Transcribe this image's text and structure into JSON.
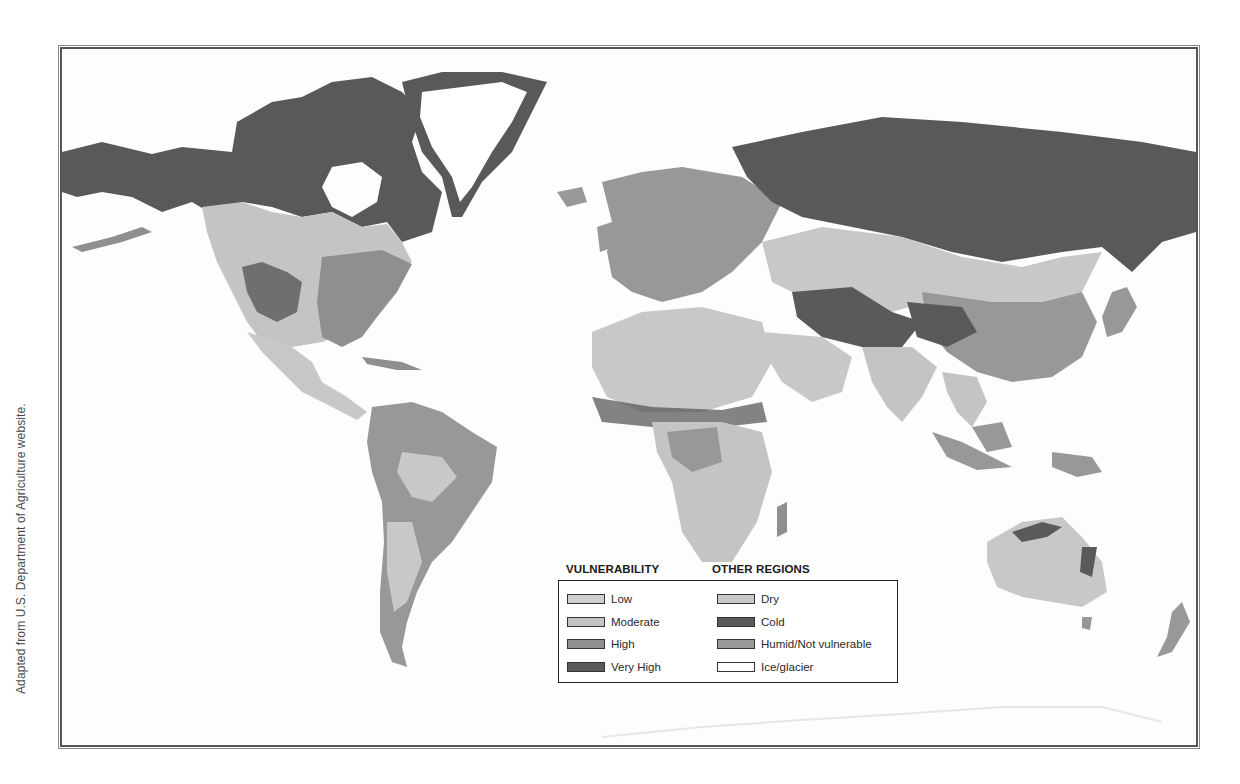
{
  "credit": "Adapted from U.S. Department of Agriculture website.",
  "map": {
    "type": "world choropleth (grayscale)",
    "topic": "Vulnerability of land regions",
    "colors": {
      "ocean": "#fdfdfd",
      "low": "#cfcfcf",
      "moderate": "#c4c4c4",
      "high": "#8f8f8f",
      "very_high": "#5a5a5a",
      "dry": "#c8c8c8",
      "cold": "#595959",
      "humid": "#989898",
      "ice": "#ffffff"
    }
  },
  "legend": {
    "vulnerability_header": "VULNERABILITY",
    "other_header": "OTHER REGIONS",
    "vulnerability": [
      {
        "label": "Low",
        "color": "#cfcfcf"
      },
      {
        "label": "Moderate",
        "color": "#c4c4c4"
      },
      {
        "label": "High",
        "color": "#8f8f8f"
      },
      {
        "label": "Very High",
        "color": "#5a5a5a"
      }
    ],
    "other": [
      {
        "label": "Dry",
        "color": "#c8c8c8"
      },
      {
        "label": "Cold",
        "color": "#595959"
      },
      {
        "label": "Humid/Not vulnerable",
        "color": "#989898"
      },
      {
        "label": "Ice/glacier",
        "color": "#ffffff"
      }
    ]
  }
}
